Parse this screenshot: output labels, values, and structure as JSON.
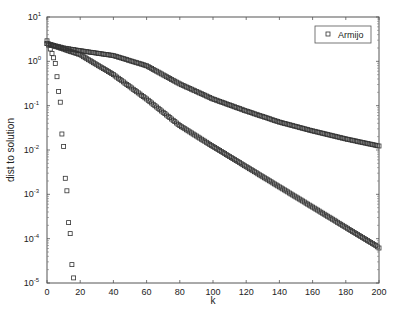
{
  "chart_data": {
    "type": "scatter",
    "title": "",
    "xlabel": "k",
    "ylabel": "dist to solution",
    "xlim": [
      0,
      200
    ],
    "ylim": [
      1e-05,
      10
    ],
    "yscale": "log",
    "grid": false,
    "legend_position": "upper right",
    "x_ticks": [
      0,
      20,
      40,
      60,
      80,
      100,
      120,
      140,
      160,
      180,
      200
    ],
    "x_tick_labels": [
      "0",
      "20",
      "40",
      "60",
      "80",
      "100",
      "120",
      "140",
      "160",
      "180",
      "200"
    ],
    "y_ticks_log10": [
      1,
      0,
      -1,
      -2,
      -3,
      -4,
      -5
    ],
    "y_tick_labels": [
      {
        "base": "10",
        "exp": "1"
      },
      {
        "base": "10",
        "exp": "0"
      },
      {
        "base": "10",
        "exp": "-1"
      },
      {
        "base": "10",
        "exp": "-2"
      },
      {
        "base": "10",
        "exp": "-3"
      },
      {
        "base": "10",
        "exp": "-4"
      },
      {
        "base": "10",
        "exp": "-5"
      }
    ],
    "legend": [
      {
        "label": "Armijo",
        "marker": "square"
      }
    ],
    "marker_color": "#333333",
    "series": [
      {
        "name": "Armijo (fast)",
        "x": [
          0,
          1,
          2,
          3,
          4,
          5,
          6,
          7,
          8,
          9,
          10,
          11,
          12,
          13,
          14,
          15,
          16
        ],
        "values": [
          2.9,
          2.3,
          1.9,
          1.5,
          1.2,
          0.9,
          0.45,
          0.21,
          0.12,
          0.023,
          0.012,
          0.0023,
          0.0012,
          0.00023,
          0.00013,
          2.6e-05,
          1.3e-05
        ]
      },
      {
        "name": "Armijo (slow upper)",
        "x_start": 0,
        "x_step": 2,
        "log10_values": [
          0.4,
          0.38,
          0.36,
          0.34,
          0.32,
          0.3,
          0.288,
          0.276,
          0.264,
          0.252,
          0.24,
          0.229,
          0.218,
          0.207,
          0.196,
          0.185,
          0.174,
          0.163,
          0.152,
          0.141,
          0.13,
          0.107,
          0.084,
          0.061,
          0.038,
          0.015,
          -0.008,
          -0.031,
          -0.054,
          -0.077,
          -0.1,
          -0.141,
          -0.182,
          -0.223,
          -0.264,
          -0.305,
          -0.346,
          -0.387,
          -0.428,
          -0.469,
          -0.51,
          -0.544,
          -0.578,
          -0.612,
          -0.646,
          -0.68,
          -0.714,
          -0.748,
          -0.782,
          -0.816,
          -0.85,
          -0.877,
          -0.904,
          -0.931,
          -0.958,
          -0.985,
          -1.012,
          -1.039,
          -1.066,
          -1.093,
          -1.12,
          -1.145,
          -1.17,
          -1.195,
          -1.22,
          -1.245,
          -1.27,
          -1.295,
          -1.32,
          -1.345,
          -1.37,
          -1.39,
          -1.41,
          -1.43,
          -1.45,
          -1.47,
          -1.49,
          -1.51,
          -1.53,
          -1.55,
          -1.57,
          -1.588,
          -1.606,
          -1.624,
          -1.642,
          -1.66,
          -1.678,
          -1.696,
          -1.714,
          -1.732,
          -1.75,
          -1.766,
          -1.782,
          -1.798,
          -1.814,
          -1.83,
          -1.846,
          -1.862,
          -1.878,
          -1.894,
          -1.91
        ],
        "approx_values": {
          "0": 2.5,
          "40": 1.35,
          "80": 0.31,
          "140": 0.043,
          "200": 0.012
        }
      },
      {
        "name": "Armijo (slow lower)",
        "x_start": 0,
        "x_step": 2,
        "log10_values": [
          0.4,
          0.375,
          0.35,
          0.325,
          0.3,
          0.275,
          0.25,
          0.225,
          0.2,
          0.175,
          0.15,
          0.105,
          0.06,
          0.015,
          -0.03,
          -0.075,
          -0.12,
          -0.165,
          -0.21,
          -0.255,
          -0.3,
          -0.355,
          -0.41,
          -0.465,
          -0.52,
          -0.575,
          -0.63,
          -0.685,
          -0.74,
          -0.795,
          -0.85,
          -0.91,
          -0.97,
          -1.03,
          -1.09,
          -1.15,
          -1.21,
          -1.27,
          -1.33,
          -1.39,
          -1.45,
          -1.497,
          -1.544,
          -1.591,
          -1.638,
          -1.685,
          -1.732,
          -1.779,
          -1.826,
          -1.873,
          -1.92,
          -1.966,
          -2.011,
          -2.057,
          -2.103,
          -2.148,
          -2.194,
          -2.239,
          -2.285,
          -2.331,
          -2.376,
          -2.422,
          -2.467,
          -2.513,
          -2.559,
          -2.604,
          -2.65,
          -2.695,
          -2.741,
          -2.787,
          -2.832,
          -2.878,
          -2.923,
          -2.969,
          -3.015,
          -3.06,
          -3.106,
          -3.151,
          -3.197,
          -3.243,
          -3.288,
          -3.334,
          -3.379,
          -3.425,
          -3.471,
          -3.516,
          -3.562,
          -3.607,
          -3.653,
          -3.699,
          -3.744,
          -3.79,
          -3.835,
          -3.881,
          -3.927,
          -3.972,
          -4.018,
          -4.063,
          -4.109,
          -4.155,
          -4.21
        ],
        "approx_values": {
          "0": 2.5,
          "80": 0.035,
          "130": 0.0021,
          "200": 6e-05
        }
      }
    ]
  }
}
